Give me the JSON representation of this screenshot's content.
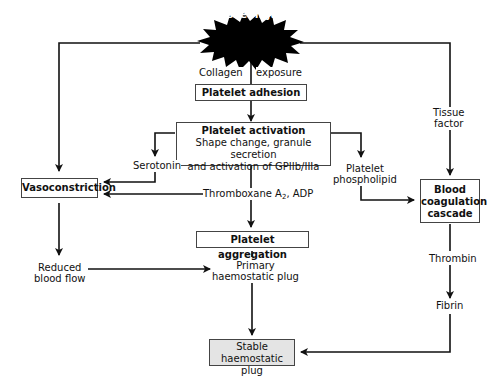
{
  "diagram": {
    "title_node": "Vessel injury",
    "nodes": {
      "platelet_adhesion": "Platelet adhesion",
      "platelet_activation_title": "Platelet activation",
      "platelet_activation_line1": "Shape change, granule secretion",
      "platelet_activation_line2": "and activation of GPIIb/IIIa",
      "vasoconstriction": "Vasoconstriction",
      "platelet_aggregation": "Platelet aggregation",
      "blood_coagulation_line1": "Blood",
      "blood_coagulation_line2": "coagulation",
      "blood_coagulation_line3": "cascade",
      "stable_plug_line1": "Stable",
      "stable_plug_line2": "haemostatic plug"
    },
    "labels": {
      "collagen": "Collagen",
      "exposure": "exposure",
      "serotonin": "Serotonin",
      "thromboxane_prefix": "Thromboxane A",
      "thromboxane_sub": "2",
      "thromboxane_suffix": ", ADP",
      "platelet_phospholipid_line1": "Platelet",
      "platelet_phospholipid_line2": "phospholipid",
      "tissue_factor_line1": "Tissue",
      "tissue_factor_line2": "factor",
      "reduced_flow_line1": "Reduced",
      "reduced_flow_line2": "blood flow",
      "primary_plug_line1": "Primary",
      "primary_plug_line2": "haemostatic plug",
      "thrombin": "Thrombin",
      "fibrin": "Fibrin"
    },
    "colors": {
      "line": "#111111",
      "box_border": "#444444",
      "stable_plug_fill": "#e4e4e4",
      "burst_fill": "#000000",
      "burst_text": "#ffffff"
    }
  }
}
